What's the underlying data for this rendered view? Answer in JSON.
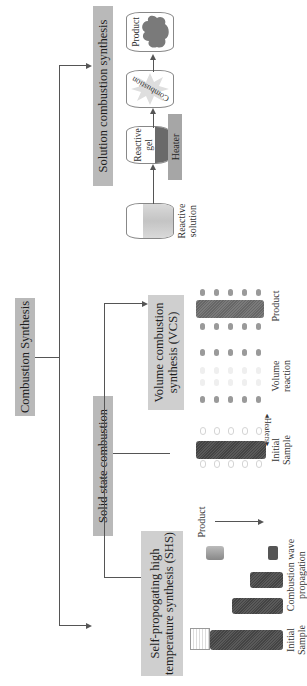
{
  "root": {
    "label": "Combustion Synthesis"
  },
  "branches": {
    "solid_state": {
      "label": "Solid state combustion",
      "children": {
        "shs": {
          "label_line1": "Self-propogating high",
          "label_line2": "temperature synthesis (SHS)",
          "stages": [
            "Initial Sample",
            "Combustion wave propagation"
          ],
          "stage_initial_line1": "Initial",
          "stage_initial_line2": "Sample",
          "stage_wave_line1": "Combustion wave",
          "stage_wave_line2": "propagation",
          "product_label": "Product"
        },
        "vcs": {
          "label_line1": "Volume combustion",
          "label_line2": "synthesis (VCS)",
          "heaters_label": "Heaters",
          "stage_initial_line1": "Initial",
          "stage_initial_line2": "Sample",
          "stage_volume_line1": "Volume",
          "stage_volume_line2": "reaction",
          "stage_product": "Product"
        }
      }
    },
    "solution": {
      "label": "Solution combustion synthesis",
      "steps": {
        "reactive_solution_line1": "Reactive",
        "reactive_solution_line2": "solution",
        "reactive_gel_line1": "Reactive",
        "reactive_gel_line2": "gel",
        "heater": "Heater",
        "combustion": "Combustion",
        "product": "Product"
      }
    }
  },
  "colors": {
    "box_fill": "#b9b9b9",
    "line": "#555555",
    "sample_fill": "#4a4a4a",
    "heater_fill": "#a6a6a6"
  }
}
